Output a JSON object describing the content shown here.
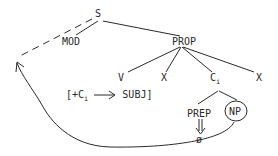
{
  "diagram": {
    "type": "syntactic-tree",
    "nodes": {
      "S": "S",
      "MOD": "MOD",
      "PROP": "PROP",
      "V": "V",
      "X1": "X",
      "C": "C",
      "C_sub": "i",
      "X2": "X",
      "PREP": "PREP",
      "NP": "NP",
      "EMPTY": "ø"
    },
    "rule": {
      "open": "[+C",
      "sub": "i",
      "target": "SUBJ]"
    },
    "edges": [
      [
        "S",
        "MOD"
      ],
      [
        "S",
        "PROP"
      ],
      [
        "PROP",
        "V"
      ],
      [
        "PROP",
        "X1"
      ],
      [
        "PROP",
        "C"
      ],
      [
        "PROP",
        "X2"
      ],
      [
        "C",
        "PREP"
      ],
      [
        "C",
        "NP"
      ],
      [
        "PREP",
        "EMPTY",
        "double-arrow"
      ]
    ],
    "movement": {
      "from": "NP",
      "to": "S-left (dashed)",
      "style": "curved arrow"
    },
    "colors": {
      "ink": "#2a2a2a",
      "background": "#ffffff"
    }
  }
}
